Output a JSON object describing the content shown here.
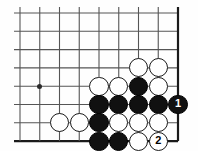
{
  "figure": {
    "kind": "go-board-diagram",
    "title": "",
    "board": {
      "columns": 9,
      "rows": 8,
      "origin_x": 20,
      "origin_y": 13,
      "spacing_x": 19.75,
      "spacing_y": 18.3,
      "line_color": "#555555",
      "edge_color": "#1a1a1a",
      "line_width": 1.1,
      "edge_width": 2.2,
      "background": "#fefefe",
      "edges": {
        "right": true,
        "bottom": true,
        "top": false,
        "left": false
      }
    },
    "star_points": [
      {
        "name": "hoshi",
        "col": 1,
        "row": 4
      }
    ],
    "stone_radius": 9.6,
    "stones": [
      {
        "color": "white",
        "col": 6,
        "row": 3,
        "label": ""
      },
      {
        "color": "white",
        "col": 7,
        "row": 3,
        "label": ""
      },
      {
        "color": "white",
        "col": 4,
        "row": 4,
        "label": ""
      },
      {
        "color": "white",
        "col": 5,
        "row": 4,
        "label": ""
      },
      {
        "color": "black",
        "col": 6,
        "row": 4,
        "label": ""
      },
      {
        "color": "white",
        "col": 7,
        "row": 4,
        "label": ""
      },
      {
        "color": "black",
        "col": 4,
        "row": 5,
        "label": ""
      },
      {
        "color": "black",
        "col": 5,
        "row": 5,
        "label": ""
      },
      {
        "color": "black",
        "col": 6,
        "row": 5,
        "label": ""
      },
      {
        "color": "black",
        "col": 7,
        "row": 5,
        "label": ""
      },
      {
        "color": "black",
        "col": 8,
        "row": 5,
        "label": "1"
      },
      {
        "color": "white",
        "col": 2,
        "row": 6,
        "label": ""
      },
      {
        "color": "white",
        "col": 3,
        "row": 6,
        "label": ""
      },
      {
        "color": "black",
        "col": 4,
        "row": 6,
        "label": ""
      },
      {
        "color": "white",
        "col": 5,
        "row": 6,
        "label": ""
      },
      {
        "color": "white",
        "col": 6,
        "row": 6,
        "label": ""
      },
      {
        "color": "white",
        "col": 7,
        "row": 6,
        "label": ""
      },
      {
        "color": "black",
        "col": 4,
        "row": 7,
        "label": ""
      },
      {
        "color": "black",
        "col": 5,
        "row": 7,
        "label": ""
      },
      {
        "color": "white",
        "col": 6,
        "row": 7,
        "label": ""
      },
      {
        "color": "white",
        "col": 7,
        "row": 7,
        "label": "2"
      }
    ],
    "move_labels": [
      {
        "number": "1",
        "color": "black"
      },
      {
        "number": "2",
        "color": "white"
      }
    ]
  }
}
